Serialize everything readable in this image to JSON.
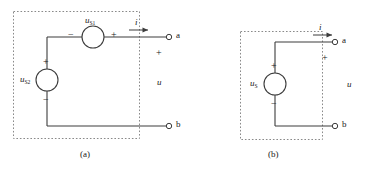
{
  "figure": {
    "panels": [
      {
        "id": "a",
        "caption": "(a)",
        "sources": [
          {
            "name": "series-voltage-source-top",
            "symbol": "u",
            "subscript": "S1",
            "orientation": "horizontal",
            "left_sign": "−",
            "right_sign": "+"
          },
          {
            "name": "voltage-source-left",
            "symbol": "u",
            "subscript": "S2",
            "orientation": "vertical",
            "top_sign": "+",
            "bottom_sign": "−"
          }
        ],
        "current": {
          "symbol": "i",
          "direction": "right"
        },
        "port_voltage": {
          "symbol": "u",
          "plus_sign": "+"
        },
        "terminals": [
          {
            "name": "terminal-a",
            "label": "a"
          },
          {
            "name": "terminal-b",
            "label": "b"
          }
        ]
      },
      {
        "id": "b",
        "caption": "(b)",
        "sources": [
          {
            "name": "equivalent-voltage-source",
            "symbol": "u",
            "subscript": "S",
            "orientation": "vertical",
            "top_sign": "+",
            "bottom_sign": "−"
          }
        ],
        "current": {
          "symbol": "i",
          "direction": "right"
        },
        "port_voltage": {
          "symbol": "u",
          "plus_sign": "+"
        },
        "terminals": [
          {
            "name": "terminal-a",
            "label": "a"
          },
          {
            "name": "terminal-b",
            "label": "b"
          }
        ]
      }
    ]
  },
  "colors": {
    "wire": "#3c3c3c",
    "dotted_box": "#8a8a8a",
    "text": "#1a1a1a",
    "background": "#ffffff"
  }
}
